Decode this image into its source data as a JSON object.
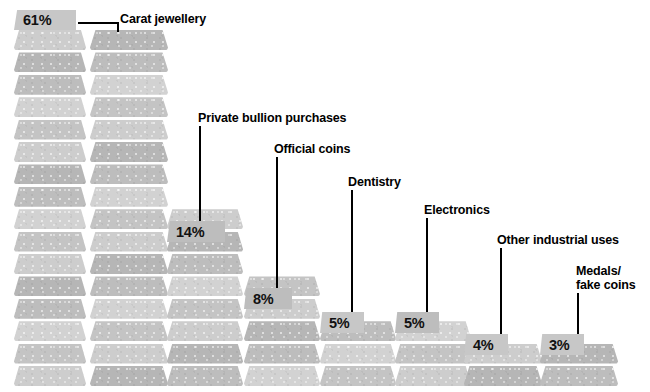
{
  "figure": {
    "title": "",
    "background_color": "#ffffff",
    "bar_color": "#c9c9c9",
    "badge_color": "#bdbdbd",
    "label_color": "#000000"
  },
  "chart_data": {
    "type": "bar",
    "title": "",
    "subtitle": "",
    "xlabel": "",
    "ylabel": "",
    "unit": "%",
    "note": "Pictorial stacked gold-bar chart; each column is built of stacked gold bars whose height encodes the share.",
    "categories": [
      "Carat jewellery",
      "Private bullion purchases",
      "Official coins",
      "Dentistry",
      "Electronics",
      "Other industrial uses",
      "Medals/\nfake coins"
    ],
    "values": [
      61,
      14,
      8,
      5,
      5,
      4,
      3
    ],
    "value_labels": [
      "61%",
      "14%",
      "8%",
      "5%",
      "5%",
      "4%",
      "3%"
    ],
    "legend": [],
    "grid": false,
    "ylim": [
      0,
      61
    ]
  },
  "columns": [
    {
      "id": "col-1",
      "category": "Carat jewellery",
      "value_label": "61%",
      "bar_count": 16,
      "left": 14,
      "width": 72,
      "badge": {
        "text": "61%",
        "left": 14,
        "top": 10,
        "width": 62,
        "height": 20,
        "tone": "light"
      }
    },
    {
      "id": "col-2",
      "category": "Carat jewellery",
      "value_label": "",
      "bar_count": 16,
      "left": 90,
      "width": 78,
      "badge": null
    },
    {
      "id": "col-3",
      "category": "Private bullion purchases",
      "value_label": "14%",
      "bar_count": 8,
      "left": 167,
      "width": 76,
      "badge": {
        "text": "14%",
        "left": 167,
        "top": 221,
        "width": 58,
        "height": 21,
        "tone": "dark"
      }
    },
    {
      "id": "col-4",
      "category": "Official coins",
      "value_label": "8%",
      "bar_count": 5,
      "left": 244,
      "width": 76,
      "badge": {
        "text": "8%",
        "left": 244,
        "top": 288,
        "width": 48,
        "height": 21,
        "tone": "dark"
      }
    },
    {
      "id": "col-5",
      "category": "Dentistry",
      "value_label": "5%",
      "bar_count": 3,
      "left": 320,
      "width": 76,
      "badge": {
        "text": "5%",
        "left": 320,
        "top": 312,
        "width": 44,
        "height": 21,
        "tone": "light"
      }
    },
    {
      "id": "col-6",
      "category": "Electronics",
      "value_label": "5%",
      "bar_count": 3,
      "left": 395,
      "width": 76,
      "badge": {
        "text": "5%",
        "left": 395,
        "top": 312,
        "width": 44,
        "height": 21,
        "tone": "dark"
      }
    },
    {
      "id": "col-7",
      "category": "Other industrial uses",
      "value_label": "4%",
      "bar_count": 2,
      "left": 464,
      "width": 78,
      "badge": {
        "text": "4%",
        "left": 464,
        "top": 334,
        "width": 44,
        "height": 21,
        "tone": "light"
      }
    },
    {
      "id": "col-8",
      "category": "Medals/fake coins",
      "value_label": "3%",
      "bar_count": 2,
      "left": 540,
      "width": 78,
      "badge": {
        "text": "3%",
        "left": 540,
        "top": 334,
        "width": 44,
        "height": 21,
        "tone": "light"
      }
    }
  ],
  "callouts": [
    {
      "id": "callout-carat-jewellery",
      "text": "Carat jewellery",
      "left": 120,
      "top": 13,
      "line2": ""
    },
    {
      "id": "callout-private-bullion",
      "text": "Private bullion purchases",
      "left": 198,
      "top": 112,
      "line2": ""
    },
    {
      "id": "callout-official-coins",
      "text": "Official coins",
      "left": 274,
      "top": 143,
      "line2": ""
    },
    {
      "id": "callout-dentistry",
      "text": "Dentistry",
      "left": 348,
      "top": 176,
      "line2": ""
    },
    {
      "id": "callout-electronics",
      "text": "Electronics",
      "left": 424,
      "top": 204,
      "line2": ""
    },
    {
      "id": "callout-other-industrial",
      "text": "Other industrial uses",
      "left": 497,
      "top": 234,
      "line2": ""
    },
    {
      "id": "callout-medals",
      "text": "Medals/",
      "left": 576,
      "top": 265,
      "line2": "fake coins"
    }
  ]
}
